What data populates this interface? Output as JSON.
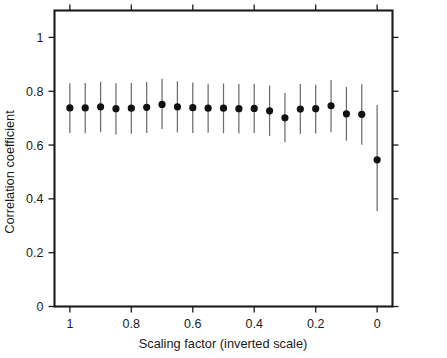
{
  "chart_data": {
    "type": "scatter",
    "title": "",
    "subtitle": "",
    "xlabel": "Scaling factor (inverted scale)",
    "ylabel": "Correlation coefficient",
    "xlim": [
      1.05,
      -0.05
    ],
    "ylim": [
      0,
      1.1
    ],
    "x_inverted": true,
    "grid": false,
    "legend": null,
    "x_ticks": [
      1,
      0.8,
      0.6,
      0.4,
      0.2,
      0
    ],
    "x_tick_labels": [
      "1",
      "0.8",
      "0.6",
      "0.4",
      "0.2",
      "0"
    ],
    "y_ticks": [
      0,
      0.2,
      0.4,
      0.6,
      0.8,
      1
    ],
    "y_tick_labels": [
      "0",
      "0.2",
      "0.4",
      "0.6",
      "0.8",
      "1"
    ],
    "marker_style": "filled-circle",
    "error_bar_style": "vertical-line-no-caps",
    "x": [
      1.0,
      0.95,
      0.9,
      0.85,
      0.8,
      0.75,
      0.7,
      0.65,
      0.6,
      0.55,
      0.5,
      0.45,
      0.4,
      0.35,
      0.3,
      0.25,
      0.2,
      0.15,
      0.1,
      0.05,
      0.0
    ],
    "values": [
      0.738,
      0.738,
      0.742,
      0.735,
      0.737,
      0.74,
      0.751,
      0.742,
      0.739,
      0.737,
      0.737,
      0.735,
      0.736,
      0.727,
      0.701,
      0.734,
      0.735,
      0.746,
      0.716,
      0.714,
      0.545
    ],
    "err_low": [
      0.645,
      0.644,
      0.648,
      0.639,
      0.642,
      0.645,
      0.66,
      0.647,
      0.645,
      0.646,
      0.644,
      0.644,
      0.645,
      0.634,
      0.61,
      0.641,
      0.643,
      0.648,
      0.616,
      0.601,
      0.355
    ],
    "err_high": [
      0.83,
      0.831,
      0.835,
      0.83,
      0.831,
      0.834,
      0.846,
      0.837,
      0.832,
      0.828,
      0.829,
      0.827,
      0.828,
      0.821,
      0.793,
      0.827,
      0.824,
      0.842,
      0.816,
      0.826,
      0.749
    ]
  },
  "style": {
    "axis_color": "#1a1a1a",
    "marker_color": "#111111",
    "error_bar_color": "#6d6d6d",
    "background_color": "#ffffff"
  }
}
